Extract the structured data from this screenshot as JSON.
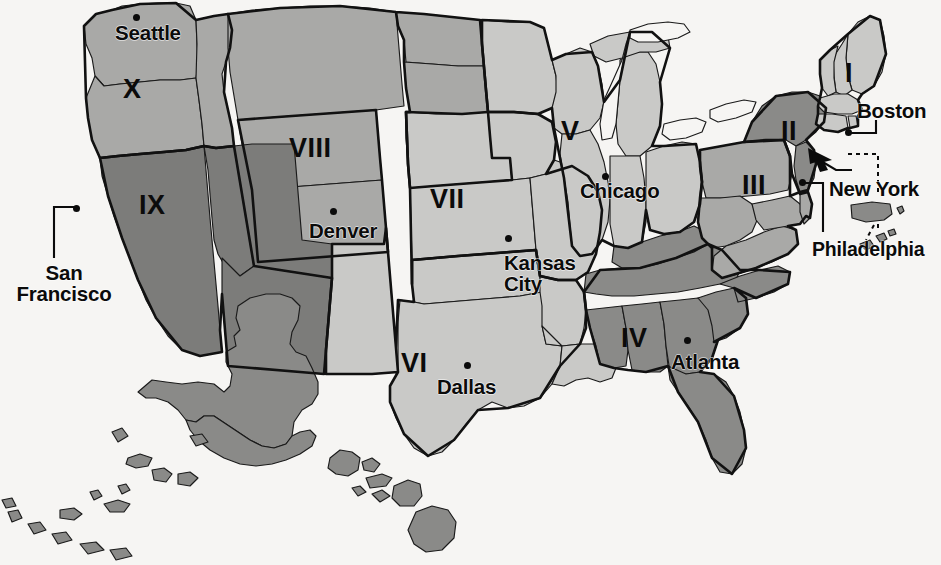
{
  "map": {
    "title": "United States Federal Regions Map",
    "background_color": "#f6f5f3",
    "outline_color": "#111111",
    "tones": {
      "light": "#c9c9c7",
      "mid": "#a9a9a7",
      "dark": "#8a8a88",
      "darker": "#7c7c7a",
      "lake": "#f6f5f3"
    }
  },
  "regions": [
    {
      "id": "region-1",
      "label": "I",
      "x": 845,
      "y": 60,
      "tone": "light"
    },
    {
      "id": "region-2",
      "label": "II",
      "x": 781,
      "y": 118,
      "tone": "dark"
    },
    {
      "id": "region-3",
      "label": "III",
      "x": 742,
      "y": 172,
      "tone": "mid"
    },
    {
      "id": "region-4",
      "label": "IV",
      "x": 621,
      "y": 325,
      "tone": "dark"
    },
    {
      "id": "region-5",
      "label": "V",
      "x": 561,
      "y": 118,
      "tone": "light"
    },
    {
      "id": "region-6",
      "label": "VI",
      "x": 401,
      "y": 350,
      "tone": "light"
    },
    {
      "id": "region-7",
      "label": "VII",
      "x": 430,
      "y": 186,
      "tone": "light"
    },
    {
      "id": "region-8",
      "label": "VIII",
      "x": 289,
      "y": 135,
      "tone": "mid"
    },
    {
      "id": "region-9",
      "label": "IX",
      "x": 139,
      "y": 192,
      "tone": "darker"
    },
    {
      "id": "region-10",
      "label": "X",
      "x": 123,
      "y": 76,
      "tone": "mid"
    }
  ],
  "cities": [
    {
      "id": "seattle",
      "label": "Seattle",
      "label_x": 115,
      "label_y": 22,
      "dot_x": 133,
      "dot_y": 14,
      "leader": "none"
    },
    {
      "id": "san-francisco",
      "label": "San\nFrancisco",
      "label_x": 8,
      "label_y": 262,
      "dot_x": 73,
      "dot_y": 205,
      "leader": "elbow-left"
    },
    {
      "id": "denver",
      "label": "Denver",
      "label_x": 309,
      "label_y": 220,
      "dot_x": 330,
      "dot_y": 208,
      "leader": "none"
    },
    {
      "id": "kansas-city",
      "label": "Kansas\nCity",
      "label_x": 504,
      "label_y": 252,
      "dot_x": 505,
      "dot_y": 235,
      "leader": "none"
    },
    {
      "id": "dallas",
      "label": "Dallas",
      "label_x": 437,
      "label_y": 376,
      "dot_x": 464,
      "dot_y": 362,
      "leader": "none"
    },
    {
      "id": "chicago",
      "label": "Chicago",
      "label_x": 580,
      "label_y": 180,
      "dot_x": 602,
      "dot_y": 173,
      "leader": "none"
    },
    {
      "id": "atlanta",
      "label": "Atlanta",
      "label_x": 671,
      "label_y": 351,
      "dot_x": 684,
      "dot_y": 337,
      "leader": "none"
    },
    {
      "id": "boston",
      "label": "Boston",
      "label_x": 857,
      "label_y": 100,
      "dot_x": 846,
      "dot_y": 131,
      "leader": "elbow-right"
    },
    {
      "id": "new-york",
      "label": "New York",
      "label_x": 829,
      "label_y": 178,
      "dot_x": 813,
      "dot_y": 156,
      "leader": "elbow-right"
    },
    {
      "id": "philadelphia",
      "label": "Philadelphia",
      "label_x": 812,
      "label_y": 239,
      "dot_x": 800,
      "dot_y": 181,
      "leader": "elbow-right"
    }
  ],
  "territories": [
    {
      "id": "alaska",
      "label": "Alaska",
      "tone": "dark"
    },
    {
      "id": "hawaii",
      "label": "Hawaii",
      "tone": "dark"
    },
    {
      "id": "puerto-rico",
      "label": "Puerto Rico",
      "tone": "dark"
    },
    {
      "id": "virgin-islands",
      "label": "Virgin Islands",
      "tone": "dark"
    }
  ]
}
